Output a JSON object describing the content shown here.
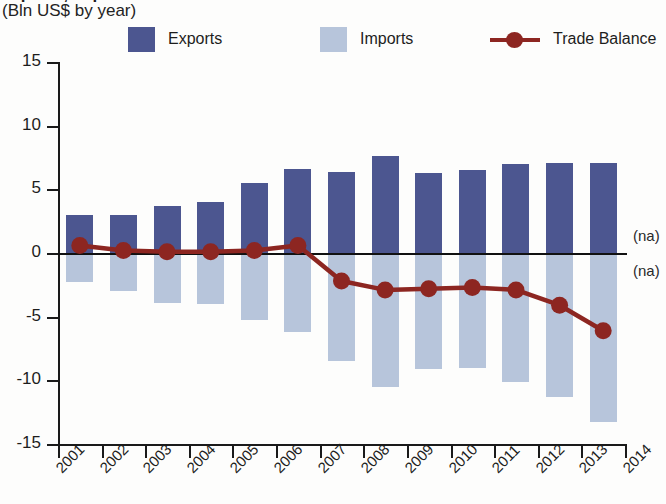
{
  "header": {
    "title_clipped": "Exports, Imports and Trade Balance",
    "subtitle": "(Bln US$ by year)"
  },
  "legend": {
    "items": [
      {
        "label": "Exports",
        "type": "swatch",
        "color": "#4c5690"
      },
      {
        "label": "Imports",
        "type": "swatch",
        "color": "#b7c5db"
      },
      {
        "label": "Trade Balance",
        "type": "line",
        "color": "#8d2621"
      }
    ]
  },
  "annotations": [
    {
      "text": "(na)",
      "value": 1.2
    },
    {
      "text": "(na)",
      "value": -1.6
    }
  ],
  "colors": {
    "exports": "#4c5690",
    "imports": "#b7c5db",
    "balance": "#8d2621",
    "axis": "#1a1a1a",
    "background": "#fdfdfc"
  },
  "chart_data": {
    "type": "bar",
    "title": "Exports, Imports and Trade Balance",
    "subtitle": "(Bln US$ by year)",
    "xlabel": "",
    "ylabel": "Bln US$",
    "ylim": [
      -15,
      15
    ],
    "yticks": [
      15,
      10,
      5,
      0,
      -5,
      -10,
      -15
    ],
    "ytick_labels": [
      "15",
      "10",
      "5",
      "0",
      "-5",
      "-10",
      "-15"
    ],
    "grid": false,
    "legend_position": "top",
    "categories": [
      "2001",
      "2002",
      "2003",
      "2004",
      "2005",
      "2006",
      "2007",
      "2008",
      "2009",
      "2010",
      "2011",
      "2012",
      "2013"
    ],
    "xtick_labels": [
      "2001",
      "2002",
      "2003",
      "2004",
      "2005",
      "2006",
      "2007",
      "2008",
      "2009",
      "2010",
      "2011",
      "2012",
      "2013",
      "2014"
    ],
    "series": [
      {
        "name": "Exports",
        "type": "bar",
        "color": "#4c5690",
        "values": [
          3.0,
          3.0,
          3.7,
          4.0,
          5.5,
          6.6,
          6.4,
          7.6,
          6.3,
          6.5,
          7.0,
          7.1,
          7.1
        ]
      },
      {
        "name": "Imports",
        "type": "bar",
        "color": "#b7c5db",
        "values": [
          -2.3,
          -3.0,
          -3.9,
          -4.0,
          -5.3,
          -6.2,
          -8.5,
          -10.5,
          -9.1,
          -9.0,
          -10.1,
          -11.3,
          -13.3
        ]
      },
      {
        "name": "Trade Balance",
        "type": "line",
        "color": "#8d2621",
        "values": [
          0.6,
          0.2,
          0.1,
          0.1,
          0.2,
          0.6,
          -2.2,
          -2.9,
          -2.8,
          -2.7,
          -2.9,
          -4.1,
          -6.1
        ]
      }
    ]
  }
}
